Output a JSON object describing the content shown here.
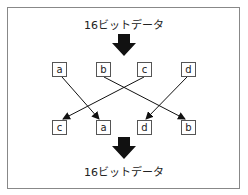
{
  "top_label": "16ビットデータ",
  "bottom_label": "16ビットデータ",
  "input_boxes": [
    "a",
    "b",
    "c",
    "d"
  ],
  "output_boxes": [
    "c",
    "a",
    "d",
    "b"
  ],
  "mapping": [
    {
      "from": "a",
      "to": "a"
    },
    {
      "from": "b",
      "to": "b"
    },
    {
      "from": "c",
      "to": "c"
    },
    {
      "from": "d",
      "to": "d"
    }
  ]
}
